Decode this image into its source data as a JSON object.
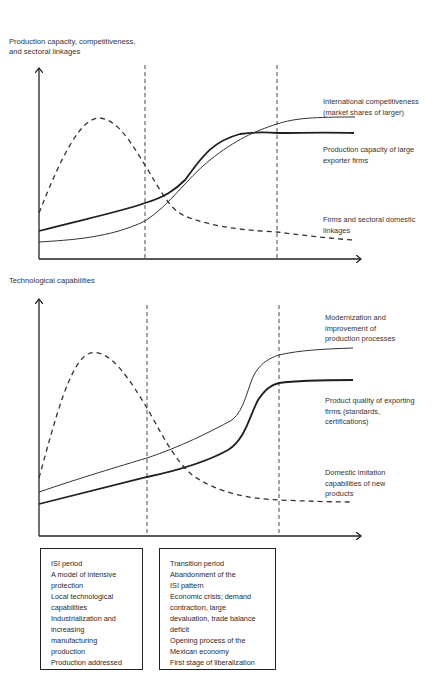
{
  "top_chart": {
    "y_axis_label": "Production capacity, competitiveness,\nand sectoral linkages",
    "series": [
      {
        "name": "International competitiveness (market shares of larger)",
        "label": "International competitiveness\n(market shares of larger)",
        "style": "solid-thin"
      },
      {
        "name": "Production capacity of large exporter firms",
        "label": "Production capacity of large\nexporter firms",
        "style": "solid-thick"
      },
      {
        "name": "Firms and sectoral domestic linkages",
        "label": "Firms and sectoral domestic\nlinkages",
        "style": "dashed"
      }
    ]
  },
  "bottom_chart": {
    "y_axis_label": "Technological capabilities",
    "series": [
      {
        "name": "Modernization and improvement of production processes",
        "label": "Modernization and\nimprovement of\nproduction processes",
        "style": "solid-thin"
      },
      {
        "name": "Product quality of exporting firms (standards, certifications)",
        "label": "Product quality of exporting\nfirms (standards,\ncertifications)",
        "style": "solid-thick"
      },
      {
        "name": "Domestic imitation capabilities of new products",
        "label": "Domestic imitation\ncapabilities of new\nproducts",
        "style": "dashed"
      }
    ]
  },
  "periods": [
    {
      "name": "ISI period",
      "lines": [
        "ISI period",
        "A model of intensive",
        "protection",
        "Local technological",
        "capabilities",
        "Industrialization and",
        "increasing",
        "manufacturing",
        "production",
        "Production addressed"
      ]
    },
    {
      "name": "Transition period",
      "lines": [
        "Transition period",
        "Abandonment of the",
        "ISI pattern",
        "Economic crisis; demand",
        "contraction, large",
        "devaluation, trade balance",
        "deficit",
        "Opening process of the",
        "Mexican economy",
        "First stage of liberalization"
      ]
    }
  ]
}
